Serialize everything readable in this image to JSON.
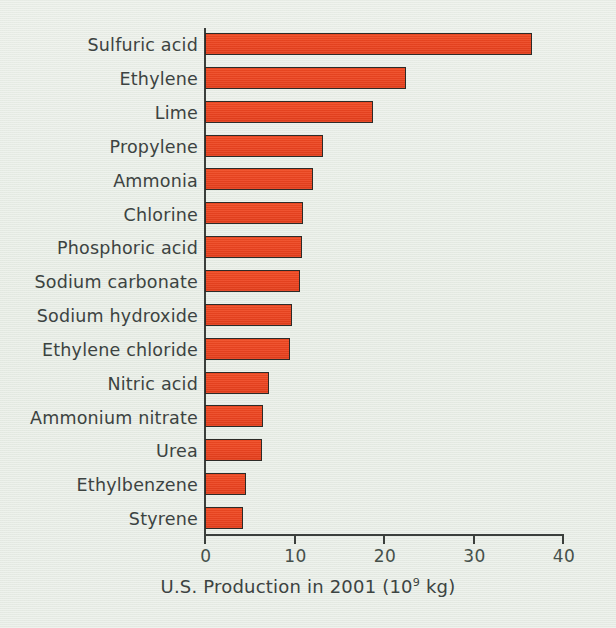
{
  "chart_data": {
    "type": "bar",
    "orientation": "horizontal",
    "title": "",
    "xlabel": "U.S. Production in 2001 (10⁹ kg)",
    "ylabel": "",
    "xlim": [
      0,
      40
    ],
    "grid": false,
    "legend": null,
    "bar_color": "#ec4420",
    "bar_edge_color": "#2d2b28",
    "background_color": "#e7ece5",
    "text_color": "#3c4341",
    "axis_color": "#3b3f3c",
    "xticks": [
      0,
      10,
      20,
      30,
      40
    ],
    "xtick_labels": [
      "0",
      "10",
      "20",
      "30",
      "40"
    ],
    "categories": [
      "Sulfuric acid",
      "Ethylene",
      "Lime",
      "Propylene",
      "Ammonia",
      "Chlorine",
      "Phosphoric acid",
      "Sodium carbonate",
      "Sodium hydroxide",
      "Ethylene chloride",
      "Nitric acid",
      "Ammonium nitrate",
      "Urea",
      "Ethylbenzene",
      "Styrene"
    ],
    "values": [
      36.5,
      22.5,
      18.8,
      13.2,
      12.1,
      11.0,
      10.8,
      10.6,
      9.7,
      9.5,
      7.2,
      6.5,
      6.4,
      4.6,
      4.3
    ]
  },
  "axis_title_parts": {
    "prefix": "U.S. Production in 2001 (10",
    "exponent": "9",
    "suffix": " kg)"
  }
}
